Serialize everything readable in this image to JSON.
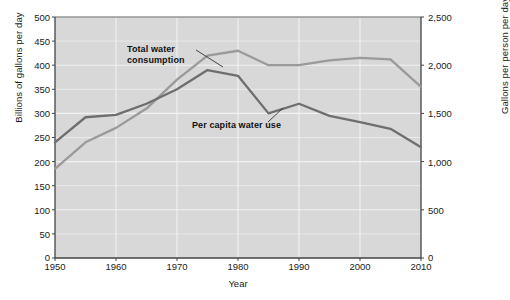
{
  "chart_data": {
    "type": "line",
    "title": "",
    "xlabel": "Year",
    "ylabel": "Billions of gallons per day",
    "ylabel_right": "Gallons per person per day",
    "xlim": [
      1950,
      2010
    ],
    "ylim": [
      0,
      500
    ],
    "ylim_right": [
      0,
      2500
    ],
    "grid": true,
    "legend_position": "inline-annotations",
    "x_ticks": [
      "1950",
      "1960",
      "1970",
      "1980",
      "1990",
      "2000",
      "2010"
    ],
    "x_tick_values": [
      1950,
      1960,
      1970,
      1980,
      1990,
      2000,
      2010
    ],
    "y_ticks_left": [
      "0",
      "50",
      "100",
      "150",
      "200",
      "250",
      "300",
      "350",
      "400",
      "450",
      "500"
    ],
    "y_tick_values_left": [
      0,
      50,
      100,
      150,
      200,
      250,
      300,
      350,
      400,
      450,
      500
    ],
    "y_ticks_right": [
      "0",
      "500",
      "1,000",
      "1,500",
      "2,000",
      "2,500"
    ],
    "y_tick_values_right": [
      0,
      500,
      1000,
      1500,
      2000,
      2500
    ],
    "x": [
      1950,
      1955,
      1960,
      1965,
      1970,
      1975,
      1980,
      1985,
      1990,
      1995,
      2000,
      2005,
      2010
    ],
    "series": [
      {
        "name": "Total water consumption",
        "axis": "left",
        "unit": "Billions of gallons per day",
        "color": "#9a9a9a",
        "values": [
          185,
          240,
          270,
          310,
          370,
          420,
          430,
          400,
          400,
          410,
          415,
          412,
          355
        ]
      },
      {
        "name": "Per capita water use",
        "axis": "right",
        "unit": "Gallons per person per day",
        "color": "#6e6e6e",
        "values_left_scale": [
          240,
          292,
          297,
          320,
          350,
          390,
          378,
          300,
          320,
          295,
          282,
          268,
          230
        ],
        "values": [
          1200,
          1460,
          1485,
          1600,
          1750,
          1950,
          1890,
          1500,
          1600,
          1475,
          1410,
          1340,
          1150
        ]
      }
    ],
    "annotations": [
      {
        "name": "total-water-consumption",
        "text_line1": "Total water",
        "text_line2": "consumption"
      },
      {
        "name": "per-capita-water-use",
        "text_line1": "Per capita water use",
        "text_line2": ""
      }
    ],
    "colors": {
      "plot_background": "#d8d8d8",
      "gridline": "#f2f2f2",
      "axis": "#444444",
      "text": "#1a1a1a",
      "series_total": "#9a9a9a",
      "series_percapita": "#6e6e6e"
    }
  }
}
